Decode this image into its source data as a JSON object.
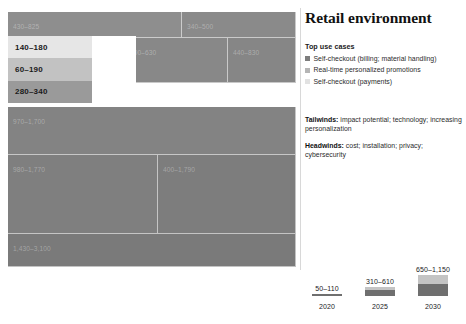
{
  "panel": {
    "title": "Retail environment",
    "usecases_heading": "Top use cases",
    "usecases": [
      {
        "label": "Self-checkout (billing; material handling)",
        "color": "#7d7d7d"
      },
      {
        "label": "Real-time personalized promotions",
        "color": "#b5b5b5"
      },
      {
        "label": "Self-checkout (payments)",
        "color": "#e2e2e2"
      }
    ],
    "tailwinds_label": "Tailwinds:",
    "tailwinds_text": " impact potential; technology; increasing personalization",
    "headwinds_label": "Headwinds:",
    "headwinds_text": " cost; installation; privacy; cybersecurity"
  },
  "tooltip": {
    "rows": [
      {
        "value": "140–180",
        "color": "#e6e6e6"
      },
      {
        "value": "60–190",
        "color": "#c2c2c2"
      },
      {
        "value": "280–340",
        "color": "#9a9a9a"
      }
    ]
  },
  "chart_data": {
    "type": "treemap",
    "title": "Retail environment",
    "unit_note": "value ranges shown per cell",
    "cells": [
      {
        "name": "",
        "value": "430–825",
        "x": 0,
        "y": 0,
        "w": 174,
        "h": 26,
        "color": "#8e8e8e"
      },
      {
        "name": "",
        "value": "340–500",
        "x": 174,
        "y": 0,
        "w": 114,
        "h": 26,
        "color": "#8a8a8a"
      },
      {
        "name": "",
        "value": "400–630",
        "x": 117,
        "y": 26,
        "w": 103,
        "h": 45,
        "color": "#888888"
      },
      {
        "name": "",
        "value": "440–830",
        "x": 220,
        "y": 26,
        "w": 68,
        "h": 45,
        "color": "#868686"
      },
      {
        "name": "",
        "value": "970–1,700",
        "x": 0,
        "y": 95,
        "w": 288,
        "h": 48,
        "color": "#838383"
      },
      {
        "name": "",
        "value": "980–1,770",
        "x": 0,
        "y": 143,
        "w": 150,
        "h": 79,
        "color": "#7f7f7f"
      },
      {
        "name": "",
        "value": "400–1,790",
        "x": 150,
        "y": 143,
        "w": 138,
        "h": 79,
        "color": "#7d7d7d"
      },
      {
        "name": "",
        "value": "1,430–3,100",
        "x": 0,
        "y": 222,
        "w": 288,
        "h": 33,
        "color": "#7a7a7a"
      }
    ],
    "legend": {
      "type": "stacked-bar",
      "columns": [
        {
          "year": "2020",
          "value": "50–110",
          "segments": [
            {
              "color": "#6f6f6f",
              "height": 2
            }
          ]
        },
        {
          "year": "2025",
          "value": "310–610",
          "segments": [
            {
              "color": "#6f6f6f",
              "height": 6
            },
            {
              "color": "#c4c4c4",
              "height": 3
            }
          ]
        },
        {
          "year": "2030",
          "value": "650–1,150",
          "segments": [
            {
              "color": "#6f6f6f",
              "height": 12
            },
            {
              "color": "#c4c4c4",
              "height": 9
            }
          ]
        }
      ]
    }
  }
}
